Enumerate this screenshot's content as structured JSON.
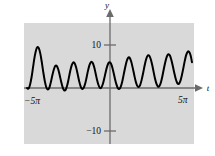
{
  "figure": {
    "background_color": "#ffffff",
    "panel_color": "#d9d9d9",
    "curve_color": "#000000",
    "axis_color": "#6b6b6b",
    "text_color": "#111111"
  },
  "labels": {
    "y_axis": "y",
    "t_axis": "t",
    "tick_pos_10": "10",
    "tick_neg_10": "−10",
    "tick_left_x": "−5π",
    "tick_right_x": "5π"
  },
  "chart_data": {
    "type": "line",
    "title": "",
    "xlabel": "t",
    "ylabel": "y",
    "xlim": [
      -15.70796,
      15.70796
    ],
    "ylim": [
      -13.5,
      13.5
    ],
    "grid": false,
    "legend": null,
    "x_ticks": [
      -15.70796,
      15.70796
    ],
    "x_tick_labels": [
      "−5π",
      "5π"
    ],
    "y_ticks": [
      -10,
      10
    ],
    "y_tick_labels": [
      "−10",
      "10"
    ],
    "series": [
      {
        "name": "y(t)",
        "formula": "5*sin(t) + 5*sin(1.2*t)",
        "color": "#000000",
        "linewidth": 2,
        "x": [
          -15.70796,
          -15.42,
          -15.14,
          -14.85,
          -14.57,
          -14.29,
          -14.0,
          -13.72,
          -13.44,
          -13.15,
          -12.87,
          -12.59,
          -12.3,
          -12.02,
          -11.74,
          -11.45,
          -11.17,
          -10.89,
          -10.6,
          -10.32,
          -10.04,
          -9.75,
          -9.47,
          -9.19,
          -8.9,
          -8.62,
          -8.34,
          -8.05,
          -7.77,
          -7.49,
          -7.2,
          -6.92,
          -6.64,
          -6.35,
          -6.07,
          -5.79,
          -5.5,
          -5.22,
          -4.94,
          -4.65,
          -4.37,
          -4.09,
          -3.8,
          -3.52,
          -3.24,
          -2.95,
          -2.67,
          -2.39,
          -2.1,
          -1.82,
          -1.54,
          -1.25,
          -0.97,
          -0.69,
          -0.4,
          -0.12,
          0.16,
          0.45,
          0.73,
          1.01,
          1.3,
          1.58,
          1.86,
          2.15,
          2.43,
          2.71,
          3.0,
          3.28,
          3.56,
          3.85,
          4.13,
          4.41,
          4.7,
          4.98,
          5.26,
          5.55,
          5.83,
          6.11,
          6.4,
          6.68,
          6.96,
          7.25,
          7.53,
          7.81,
          8.1,
          8.38,
          8.66,
          8.95,
          9.23,
          9.51,
          9.8,
          10.08,
          10.36,
          10.65,
          10.93,
          11.21,
          11.5,
          11.78,
          12.06,
          12.35,
          12.63,
          12.91,
          13.2,
          13.48,
          13.76,
          14.05,
          14.33,
          14.61,
          14.9,
          15.18,
          15.46,
          15.70796
        ],
        "y": [
          0.0,
          -0.15,
          0.72,
          2.45,
          4.72,
          7.0,
          8.74,
          9.53,
          9.22,
          7.88,
          5.83,
          3.54,
          1.49,
          0.12,
          -0.36,
          0.09,
          1.33,
          2.9,
          4.31,
          5.13,
          5.12,
          4.3,
          2.93,
          1.39,
          0.1,
          -0.56,
          -0.38,
          0.63,
          2.18,
          3.88,
          5.25,
          5.94,
          5.77,
          4.79,
          3.28,
          1.66,
          0.39,
          -0.2,
          -0.01,
          0.92,
          2.4,
          4.04,
          5.38,
          6.06,
          5.91,
          5.0,
          3.56,
          1.98,
          0.69,
          0.01,
          0.12,
          0.98,
          2.36,
          3.9,
          5.2,
          5.93,
          5.9,
          5.14,
          3.82,
          2.28,
          0.9,
          0.01,
          -0.21,
          0.33,
          1.53,
          3.17,
          4.89,
          6.29,
          7.05,
          7.0,
          6.16,
          4.74,
          3.08,
          1.57,
          0.55,
          0.22,
          0.68,
          1.83,
          3.44,
          5.17,
          6.63,
          7.5,
          7.58,
          6.87,
          5.53,
          3.86,
          2.22,
          0.96,
          0.33,
          0.47,
          1.35,
          2.81,
          4.55,
          6.18,
          7.36,
          7.84,
          7.54,
          6.53,
          5.06,
          3.44,
          2.03,
          1.13,
          0.96,
          1.58,
          2.87,
          4.56,
          6.3,
          7.7,
          8.45,
          8.38,
          7.49,
          6.0
        ]
      }
    ]
  }
}
